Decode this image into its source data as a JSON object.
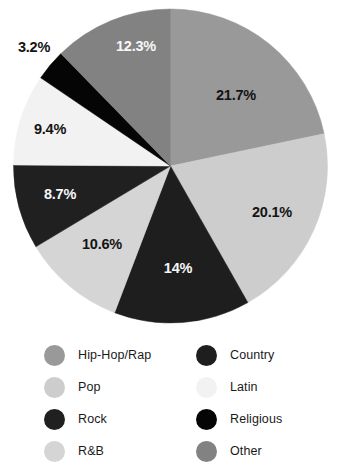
{
  "chart_data": {
    "type": "pie",
    "title": "",
    "start_angle_deg": 0,
    "direction": "clockwise",
    "legend_position": "bottom",
    "grid": false,
    "categories": [
      "Hip-Hop/Rap",
      "Pop",
      "Country",
      "R&B",
      "Rock",
      "Latin",
      "Religious",
      "Other"
    ],
    "values": [
      21.7,
      20.1,
      14,
      10.6,
      8.7,
      9.4,
      3.2,
      12.3
    ],
    "slices": [
      {
        "label": "Hip-Hop/Rap",
        "value": 21.7,
        "display": "21.7%",
        "color": "#999999",
        "label_color": "#141414",
        "label_x": 236,
        "label_y": 95
      },
      {
        "label": "Pop",
        "value": 20.1,
        "display": "20.1%",
        "color": "#cdcdcd",
        "label_color": "#141414",
        "label_x": 272,
        "label_y": 212
      },
      {
        "label": "Country",
        "value": 14,
        "display": "14%",
        "color": "#1e1e1e",
        "label_color": "#f7f7f7",
        "label_x": 178,
        "label_y": 268
      },
      {
        "label": "R&B",
        "value": 10.6,
        "display": "10.6%",
        "color": "#d5d5d5",
        "label_color": "#141414",
        "label_x": 102,
        "label_y": 244
      },
      {
        "label": "Rock",
        "value": 8.7,
        "display": "8.7%",
        "color": "#202020",
        "label_color": "#f7f7f7",
        "label_x": 60,
        "label_y": 194
      },
      {
        "label": "Latin",
        "value": 9.4,
        "display": "9.4%",
        "color": "#f2f2f2",
        "label_color": "#141414",
        "label_x": 50,
        "label_y": 129
      },
      {
        "label": "Religious",
        "value": 3.2,
        "display": "3.2%",
        "color": "#050505",
        "label_color": "#141414",
        "label_x": 34,
        "label_y": 47
      },
      {
        "label": "Other",
        "value": 12.3,
        "display": "12.3%",
        "color": "#828282",
        "label_color": "#f7f7f7",
        "label_x": 136,
        "label_y": 46
      }
    ]
  },
  "legend": {
    "left_column": [
      {
        "label": "Hip-Hop/Rap",
        "color": "#999999"
      },
      {
        "label": "Pop",
        "color": "#cdcdcd"
      },
      {
        "label": "Rock",
        "color": "#202020"
      },
      {
        "label": "R&B",
        "color": "#d5d5d5"
      }
    ],
    "right_column": [
      {
        "label": "Country",
        "color": "#1e1e1e"
      },
      {
        "label": "Latin",
        "color": "#f2f2f2"
      },
      {
        "label": "Religious",
        "color": "#050505"
      },
      {
        "label": "Other",
        "color": "#828282"
      }
    ]
  }
}
